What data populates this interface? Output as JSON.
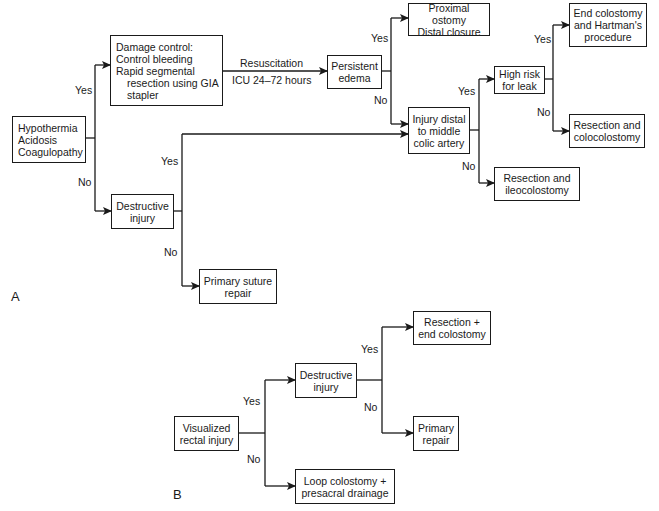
{
  "panels": {
    "a": {
      "label": "A"
    },
    "b": {
      "label": "B"
    }
  },
  "nodes": {
    "a_start": {
      "lines": [
        "Hypothermia",
        "Acidosis",
        "Coagulopathy"
      ]
    },
    "a_damage_control": {
      "line1": "Damage control:",
      "line2": "Control bleeding",
      "line3": "Rapid segmental",
      "line4": "resection using GIA",
      "line5": "stapler"
    },
    "a_persistent_edema": {
      "text": "Persistent\nedema"
    },
    "a_proximal_ostomy": {
      "text": "Proximal ostomy\nDistal closure"
    },
    "a_injury_distal": {
      "text": "Injury distal\nto middle\ncolic artery"
    },
    "a_high_risk": {
      "text": "High risk\nfor leak"
    },
    "a_end_colostomy": {
      "text": "End colostomy\nand Hartman's\nprocedure"
    },
    "a_resection_colocolostomy": {
      "text": "Resection and\ncolocolostomy"
    },
    "a_resection_ileocolostomy": {
      "text": "Resection and\nileocolostomy"
    },
    "a_destructive_injury": {
      "text": "Destructive\ninjury"
    },
    "a_primary_suture_repair": {
      "text": "Primary suture\nrepair"
    },
    "b_visualized": {
      "text": "Visualized\nrectal injury"
    },
    "b_destructive_injury": {
      "text": "Destructive\ninjury"
    },
    "b_resection_end_colostomy": {
      "text": "Resection +\nend colostomy"
    },
    "b_primary_repair": {
      "text": "Primary\nrepair"
    },
    "b_loop_colostomy": {
      "text": "Loop colostomy +\npresacral drainage"
    }
  },
  "edge_labels": {
    "a_start_yes": "Yes",
    "a_start_no": "No",
    "a_resuscitation": "Resuscitation",
    "a_icu": "ICU 24–72 hours",
    "a_edema_yes": "Yes",
    "a_edema_no": "No",
    "a_destructive_yes": "Yes",
    "a_destructive_no": "No",
    "a_distal_yes": "Yes",
    "a_distal_no": "No",
    "a_leak_yes": "Yes",
    "a_leak_no": "No",
    "b_visualized_yes": "Yes",
    "b_visualized_no": "No",
    "b_destructive_yes": "Yes",
    "b_destructive_no": "No"
  },
  "colors": {
    "stroke": "#1a1a1a",
    "background": "#ffffff"
  }
}
